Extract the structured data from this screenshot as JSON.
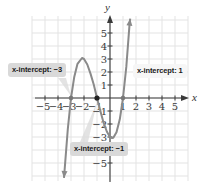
{
  "chart_data": {
    "type": "line",
    "title": "",
    "xlabel": "x",
    "ylabel": "y",
    "xlim": [
      -6,
      6
    ],
    "ylim": [
      -6.4,
      6.3
    ],
    "grid": true,
    "x_ticks": [
      -5,
      -4,
      -3,
      -2,
      -1,
      1,
      2,
      3,
      4,
      5
    ],
    "y_ticks": [
      -5,
      -3,
      -2,
      -1,
      1,
      2,
      3,
      4,
      5
    ],
    "x_tick_labels": [
      "−5",
      "−4",
      "−3",
      "−2",
      "−1",
      "1",
      "2",
      "3",
      "4",
      "5"
    ],
    "y_tick_labels": [
      "−5",
      "−3",
      "−2",
      "−1",
      "1",
      "2",
      "3",
      "4",
      "5"
    ],
    "series": [
      {
        "name": "f(x) = (x+3)(x+1)(x−1)",
        "x": [
          -3.54,
          -3.25,
          -3,
          -2.75,
          -2.5,
          -2.15,
          -2,
          -1.75,
          -1.5,
          -1.25,
          -1,
          -0.75,
          -0.5,
          -0.25,
          0,
          0.15,
          0.25,
          0.5,
          0.75,
          1,
          1.25,
          1.5,
          1.55
        ],
        "y": [
          -6.15,
          -2.4,
          0,
          1.64,
          2.63,
          3.08,
          3,
          2.58,
          1.88,
          1.02,
          0,
          -0.98,
          -1.88,
          -2.58,
          -3,
          -3.08,
          -3.05,
          -2.63,
          -1.64,
          0,
          2.39,
          5.63,
          6.1
        ],
        "arrows": "both"
      }
    ],
    "points": [
      {
        "x": -3,
        "y": 0,
        "style": "grey"
      },
      {
        "x": -1,
        "y": 0,
        "style": "dark"
      },
      {
        "x": 1,
        "y": 0,
        "style": "grey"
      }
    ],
    "annotations": [
      {
        "text": "x-intercept: −3",
        "target": [
          -3,
          0
        ]
      },
      {
        "text": "x-intercept: 1",
        "target": [
          1,
          0
        ]
      },
      {
        "text": "x-intercept: −1",
        "target": [
          -1,
          0
        ]
      }
    ]
  },
  "axes": {
    "x_name": "x",
    "y_name": "y"
  },
  "callouts": {
    "left": "x-intercept: −3",
    "right": "x-intercept: 1",
    "bottom": "x-intercept: −1"
  },
  "colors": {
    "grid": "#e3e3e3",
    "axis": "#3a3a3a",
    "curve": "#8a8a8a",
    "callout_bg": "#d9d9d9"
  }
}
